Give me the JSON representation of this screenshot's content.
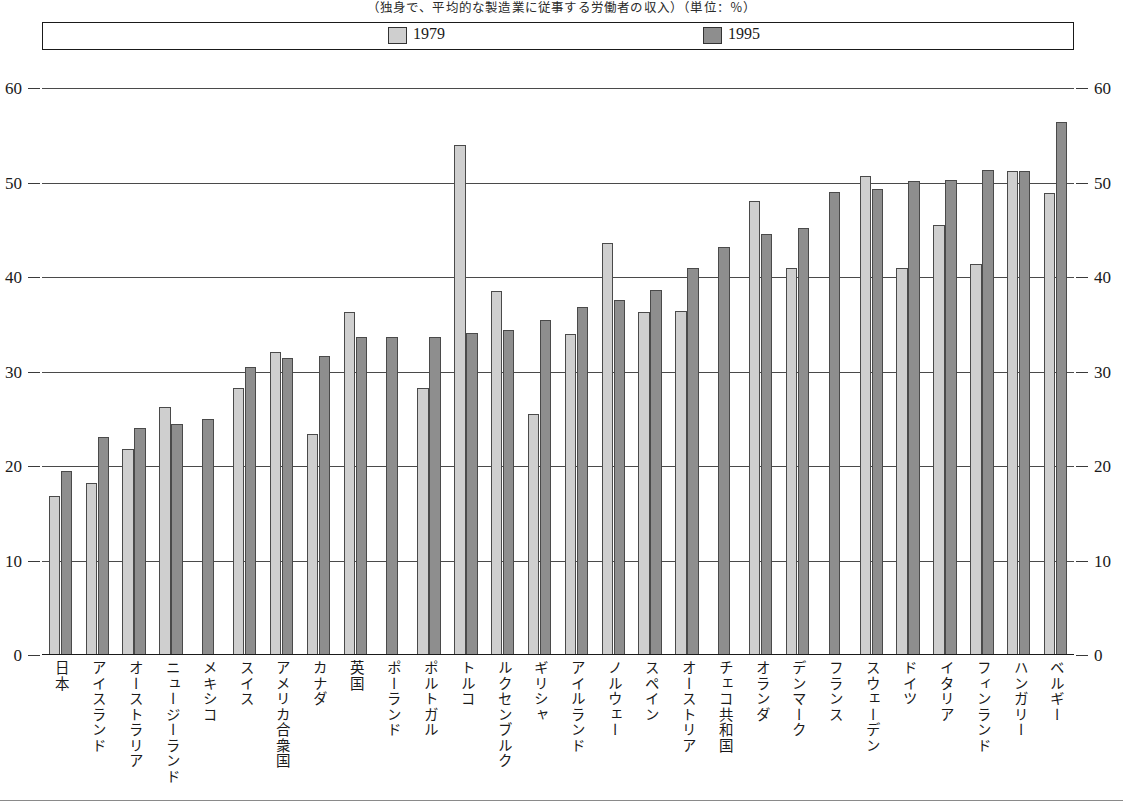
{
  "title": "（独身で、平均的な製造業に従事する労働者の収入）（単位：％）",
  "legend": {
    "entries": [
      {
        "label": "1979",
        "color": "#cfcfcf"
      },
      {
        "label": "1995",
        "color": "#8e8e8e"
      }
    ]
  },
  "axis": {
    "y_ticks": [
      "0",
      "10",
      "20",
      "30",
      "40",
      "50",
      "60"
    ]
  },
  "chart_data": {
    "type": "bar",
    "title": "（独身で、平均的な製造業に従事する労働者の収入）（単位：％）",
    "xlabel": "",
    "ylabel": "",
    "ylim": [
      0,
      60
    ],
    "yticks": [
      0,
      10,
      20,
      30,
      40,
      50,
      60
    ],
    "grid": true,
    "legend_position": "top",
    "categories": [
      "日本",
      "アイスランド",
      "オーストラリア",
      "ニュージーランド",
      "メキシコ",
      "スイス",
      "アメリカ合衆国",
      "カナダ",
      "英国",
      "ポーランド",
      "ポルトガル",
      "トルコ",
      "ルクセンブルク",
      "ギリシャ",
      "アイルランド",
      "ノルウェー",
      "スペイン",
      "オーストリア",
      "チェコ共和国",
      "オランダ",
      "デンマーク",
      "フランス",
      "スウェーデン",
      "ドイツ",
      "イタリア",
      "フィンランド",
      "ハンガリー",
      "ベルギー"
    ],
    "series": [
      {
        "name": "1979",
        "color": "#cfcfcf",
        "values": [
          16.8,
          18.2,
          21.8,
          26.2,
          null,
          28.3,
          32.1,
          23.4,
          36.3,
          null,
          28.3,
          54.0,
          38.5,
          25.5,
          34.0,
          43.6,
          36.3,
          36.4,
          null,
          48.0,
          41.0,
          null,
          50.7,
          41.0,
          45.5,
          41.4,
          51.2,
          48.9
        ]
      },
      {
        "name": "1995",
        "color": "#8e8e8e",
        "values": [
          19.5,
          23.1,
          24.0,
          24.4,
          25.0,
          30.5,
          31.4,
          31.6,
          33.6,
          33.6,
          33.6,
          34.1,
          34.4,
          35.5,
          36.8,
          37.6,
          38.6,
          41.0,
          43.2,
          44.5,
          45.2,
          49.0,
          49.3,
          50.2,
          50.3,
          51.3,
          51.2,
          56.4
        ]
      }
    ]
  }
}
